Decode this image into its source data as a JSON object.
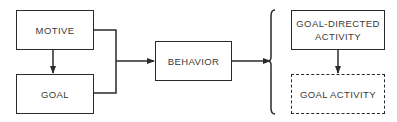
{
  "diagram": {
    "type": "flow",
    "nodes": [
      {
        "id": "motive",
        "label": "MOTIVE",
        "style": "solid"
      },
      {
        "id": "goal",
        "label": "GOAL",
        "style": "solid"
      },
      {
        "id": "behavior",
        "label": "BEHAVIOR",
        "style": "solid"
      },
      {
        "id": "goal_directed_activity",
        "label_line1": "GOAL-DIRECTED",
        "label_line2": "ACTIVITY",
        "style": "solid"
      },
      {
        "id": "goal_activity",
        "label": "GOAL ACTIVITY",
        "style": "dashed"
      }
    ],
    "edges": [
      {
        "from": "motive",
        "to": "goal"
      },
      {
        "from": "motive",
        "to": "behavior"
      },
      {
        "from": "goal",
        "to": "behavior"
      },
      {
        "from": "behavior",
        "to": "brace_group"
      },
      {
        "from": "goal_directed_activity",
        "to": "goal_activity"
      }
    ],
    "groups": [
      {
        "id": "brace_group",
        "members": [
          "goal_directed_activity",
          "goal_activity"
        ],
        "marker": "left-brace"
      }
    ],
    "colors": {
      "stroke": "#2a2a2a",
      "text": "#3a3a3a",
      "background": "#ffffff"
    }
  }
}
